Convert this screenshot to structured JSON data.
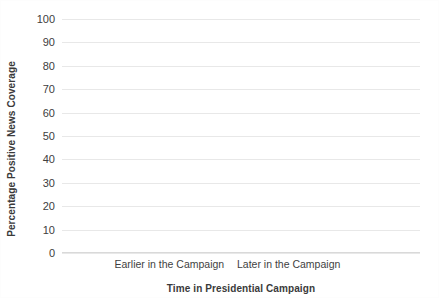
{
  "chart_data": {
    "type": "line",
    "title": "",
    "xlabel": "Time in Presidential Campaign",
    "ylabel": "Percentage Positive News Coverage",
    "categories": [
      "Earlier in the Campaign",
      "Later in the Campaign"
    ],
    "series": [
      {
        "name": "Positive News Coverage",
        "values": [
          80,
          25
        ],
        "color": "#808080"
      }
    ],
    "ylim": [
      0,
      100
    ],
    "ytick_labels": [
      "100",
      "90",
      "80",
      "70",
      "60",
      "50",
      "40",
      "30",
      "20",
      "10",
      "0"
    ],
    "ytick_values": [
      100,
      90,
      80,
      70,
      60,
      50,
      40,
      30,
      20,
      10,
      0
    ],
    "grid": true,
    "gridline_color": "#e8e8e8",
    "legend": "none",
    "background": "#ffffff"
  },
  "axes": {
    "y_title": "Percentage Positive News Coverage",
    "x_title": "Time in Presidential Campaign"
  },
  "x_labels": {
    "left": "Earlier in the Campaign",
    "right": "Later in the Campaign"
  }
}
